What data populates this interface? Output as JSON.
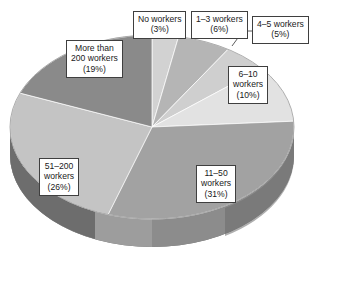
{
  "chart_data": {
    "type": "pie",
    "title": "",
    "subtitle": "",
    "xlabel": "",
    "ylabel": "",
    "style": "3d-pie",
    "legend_position": "none",
    "labels_as_callouts": true,
    "grid": false,
    "categories": [
      "No workers",
      "1–3 workers",
      "4–5 workers",
      "6–10 workers",
      "11–50 workers",
      "51–200 workers",
      "More than 200 workers"
    ],
    "values": [
      3,
      6,
      5,
      10,
      31,
      26,
      19
    ],
    "unit": "percent",
    "slice_colors": [
      "#d2d2d2",
      "#b5b5b5",
      "#cfcfcf",
      "#e2e2e2",
      "#a2a2a2",
      "#c4c4c4",
      "#8a8a8a"
    ],
    "slices": [
      {
        "label": "No workers",
        "value": 3,
        "value_text": "(3%)",
        "color": "#d2d2d2"
      },
      {
        "label": "1–3 workers",
        "value": 6,
        "value_text": "(6%)",
        "color": "#b5b5b5"
      },
      {
        "label": "4–5 workers",
        "value": 5,
        "value_text": "(5%)",
        "color": "#cfcfcf"
      },
      {
        "label": "6–10 workers",
        "value": 10,
        "value_text": "(10%)",
        "color": "#e2e2e2"
      },
      {
        "label": "11–50 workers",
        "value": 31,
        "value_text": "(31%)",
        "color": "#a2a2a2"
      },
      {
        "label": "51–200 workers",
        "value": 26,
        "value_text": "(26%)",
        "color": "#c4c4c4"
      },
      {
        "label": "More than 200 workers",
        "value": 19,
        "value_text": "(19%)",
        "color": "#8a8a8a"
      }
    ]
  },
  "callouts": {
    "no_workers": {
      "line1": "No workers",
      "line2": "(3%)"
    },
    "w_1_3": {
      "line1": "1–3 workers",
      "line2": "(6%)"
    },
    "w_4_5": {
      "line1": "4–5 workers",
      "line2": "(5%)"
    },
    "w_6_10": {
      "line1": "6–10",
      "line2": "workers",
      "line3": "(10%)"
    },
    "w_11_50": {
      "line1": "11–50",
      "line2": "workers",
      "line3": "(31%)"
    },
    "w_51_200": {
      "line1": "51–200",
      "line2": "workers",
      "line3": "(26%)"
    },
    "w_more_200": {
      "line1": "More than",
      "line2": "200 workers",
      "line3": "(19%)"
    }
  }
}
